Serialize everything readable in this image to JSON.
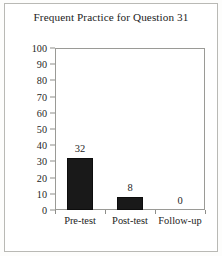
{
  "chart_data": {
    "type": "bar",
    "title": "Frequent Practice for Question 31",
    "xlabel": "",
    "ylabel": "Percentages",
    "categories": [
      "Pre-test",
      "Post-test",
      "Follow-up"
    ],
    "values": [
      32,
      8,
      0
    ],
    "data_labels": [
      "32",
      "8",
      "0"
    ],
    "ylim": [
      0,
      100
    ],
    "ytick_values": [
      100,
      90,
      80,
      70,
      60,
      50,
      40,
      30,
      20,
      10,
      0
    ],
    "ytick_labels": [
      "100",
      "90",
      "80",
      "70",
      "60",
      "50",
      "40",
      "30",
      "20",
      "10",
      "0"
    ],
    "grid": false,
    "legend": "none",
    "series": [
      {
        "name": "Percentages",
        "values": [
          32,
          8,
          0
        ],
        "color": "#191919"
      }
    ],
    "colors": {
      "bar_fill": "#191919",
      "axis_line": "#9a9a96",
      "text": "#232323",
      "background": "#ffffff",
      "frame": "#b9b9b5"
    }
  }
}
